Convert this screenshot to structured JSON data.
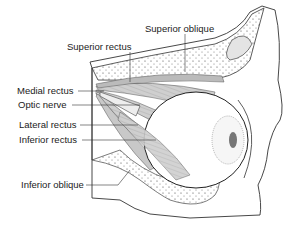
{
  "diagram": {
    "labels": {
      "superior_oblique": "Superior oblique",
      "superior_rectus": "Superior rectus",
      "medial_rectus": "Medial rectus",
      "optic_nerve": "Optic nerve",
      "lateral_rectus": "Lateral rectus",
      "inferior_rectus": "Inferior rectus",
      "inferior_oblique": "Inferior oblique"
    }
  }
}
